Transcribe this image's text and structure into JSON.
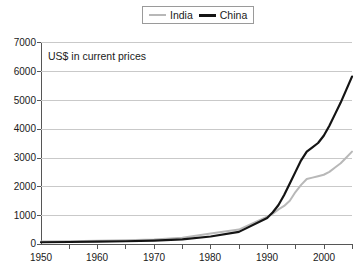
{
  "legend": {
    "position": "top-center",
    "entries": [
      {
        "label": "India",
        "color": "#b8b8b8",
        "icon": "line-swatch-icon"
      },
      {
        "label": "China",
        "color": "#141414",
        "icon": "line-swatch-icon"
      }
    ]
  },
  "annotation": {
    "text": "US$ in current prices"
  },
  "axes": {
    "y_ticks": [
      "0",
      "1000",
      "2000",
      "3000",
      "4000",
      "5000",
      "6000",
      "7000"
    ],
    "x_ticks": [
      "1950",
      "1960",
      "1970",
      "1980",
      "1990",
      "2000"
    ]
  },
  "chart_data": {
    "type": "line",
    "title": "",
    "subtitle": "",
    "annotation": "US$ in current prices",
    "xlabel": "",
    "ylabel": "",
    "xlim": [
      1950,
      2005
    ],
    "ylim": [
      0,
      7000
    ],
    "y_ticks": [
      0,
      1000,
      2000,
      3000,
      4000,
      5000,
      6000,
      7000
    ],
    "x_ticks": [
      1950,
      1960,
      1970,
      1980,
      1990,
      2000
    ],
    "x_minor_tick_step": 5,
    "grid": "horizontal",
    "legend_position": "top-center",
    "x": [
      1950,
      1955,
      1960,
      1965,
      1970,
      1975,
      1980,
      1985,
      1990,
      1991,
      1992,
      1993,
      1994,
      1995,
      1996,
      1997,
      1998,
      1999,
      2000,
      2001,
      2002,
      2003,
      2004,
      2005
    ],
    "series": [
      {
        "name": "India",
        "color": "#b8b8b8",
        "values": [
          90,
          95,
          110,
          130,
          160,
          220,
          360,
          500,
          950,
          1050,
          1200,
          1320,
          1500,
          1800,
          2050,
          2250,
          2300,
          2350,
          2400,
          2500,
          2650,
          2800,
          3000,
          3200
        ]
      },
      {
        "name": "China",
        "color": "#141414",
        "values": [
          60,
          70,
          85,
          95,
          120,
          160,
          260,
          420,
          900,
          1100,
          1350,
          1700,
          2100,
          2500,
          2900,
          3200,
          3350,
          3500,
          3750,
          4100,
          4500,
          4900,
          5350,
          5800
        ]
      }
    ]
  }
}
